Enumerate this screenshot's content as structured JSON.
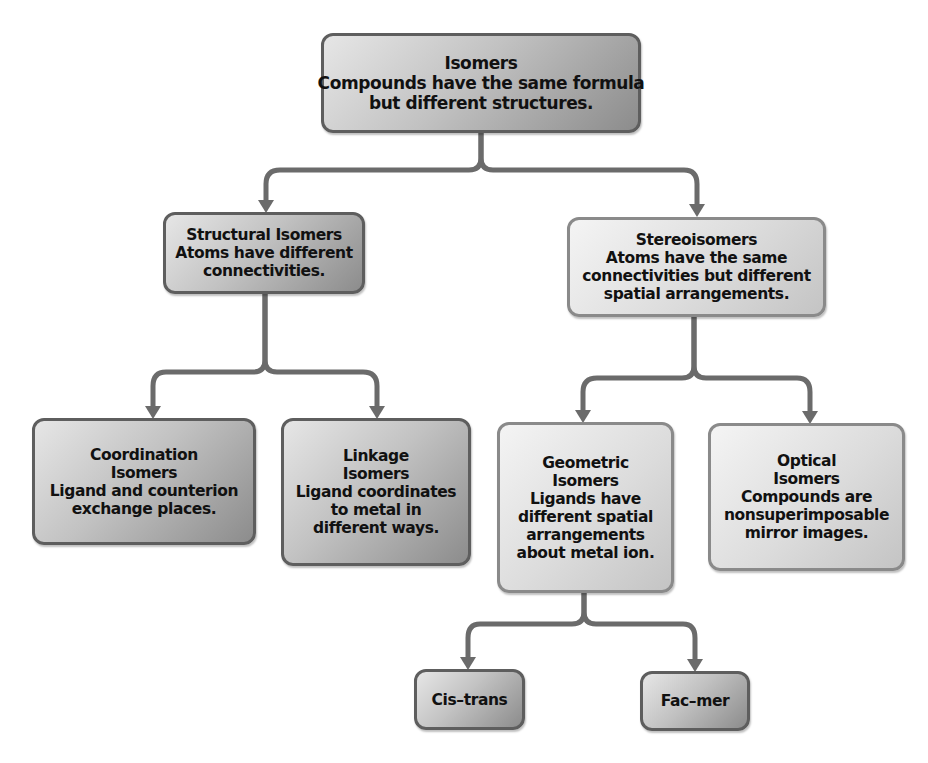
{
  "diagram": {
    "type": "hierarchy-flowchart",
    "colors": {
      "background": "#ffffff",
      "connector": "#6b6b6b",
      "box_border_dark": "#5e5e5e",
      "box_border_light": "#8a8a8a",
      "text": "#111111"
    },
    "nodes": {
      "isomers": {
        "title": "Isomers",
        "description_lines": [
          "Compounds have the same formula",
          "but different structures."
        ]
      },
      "structural": {
        "title": "Structural Isomers",
        "description_lines": [
          "Atoms have different",
          "connectivities."
        ]
      },
      "stereo": {
        "title": "Stereoisomers",
        "description_lines": [
          "Atoms have the same",
          "connectivities but different",
          "spatial arrangements."
        ]
      },
      "coordination": {
        "title_lines": [
          "Coordination",
          "Isomers"
        ],
        "description_lines": [
          "Ligand and counterion",
          "exchange places."
        ]
      },
      "linkage": {
        "title_lines": [
          "Linkage",
          "Isomers"
        ],
        "description_lines": [
          "Ligand coordinates",
          "to metal in",
          "different ways."
        ]
      },
      "geometric": {
        "title_lines": [
          "Geometric",
          "Isomers"
        ],
        "description_lines": [
          "Ligands have",
          "different spatial",
          "arrangements",
          "about metal ion."
        ]
      },
      "optical": {
        "title_lines": [
          "Optical",
          "Isomers"
        ],
        "description_lines": [
          "Compounds are",
          "nonsuperimposable",
          "mirror images."
        ]
      },
      "cis_trans": {
        "title": "Cis–trans"
      },
      "fac_mer": {
        "title": "Fac–mer"
      }
    },
    "edges": [
      [
        "isomers",
        "structural"
      ],
      [
        "isomers",
        "stereo"
      ],
      [
        "structural",
        "coordination"
      ],
      [
        "structural",
        "linkage"
      ],
      [
        "stereo",
        "geometric"
      ],
      [
        "stereo",
        "optical"
      ],
      [
        "geometric",
        "cis_trans"
      ],
      [
        "geometric",
        "fac_mer"
      ]
    ]
  }
}
